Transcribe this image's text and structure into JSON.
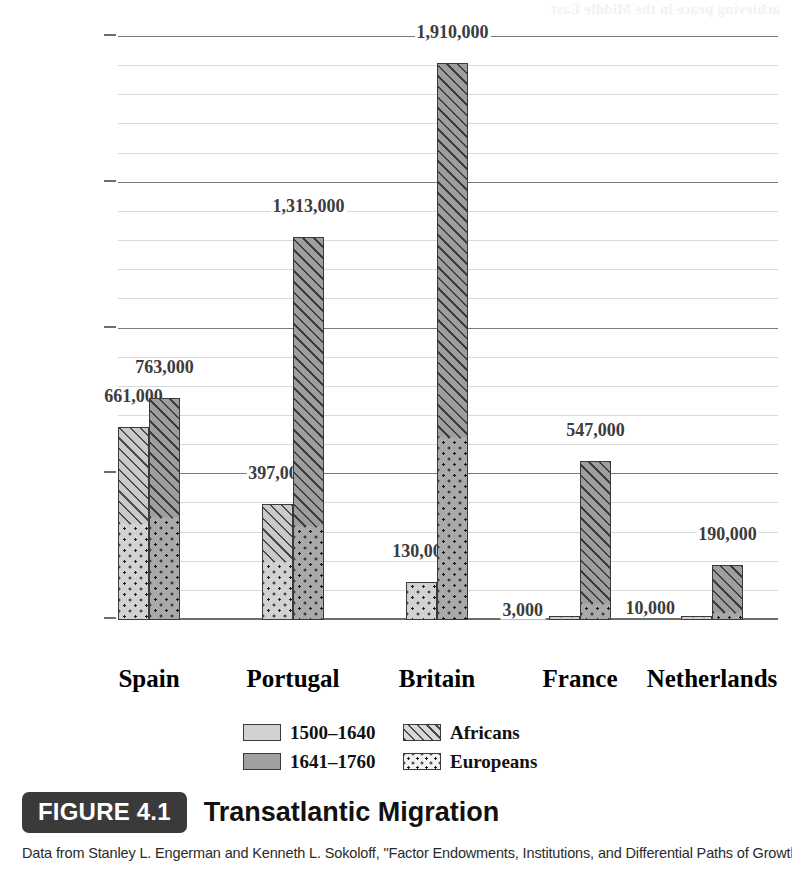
{
  "figure": {
    "badge": "FIGURE 4.1",
    "title": "Transatlantic Migration",
    "source": "Data from Stanley L. Engerman and Kenneth L. Sokoloff, \"Factor Endowments, Institutions, and Differential Paths of Growth",
    "ghost": "achieving peace in the Middle East"
  },
  "legend": {
    "period1": "1500–1640",
    "period2": "1641–1760",
    "africans": "Africans",
    "europeans": "Europeans"
  },
  "axis": {
    "yticks": [
      "0",
      "500,000",
      "1,000,000",
      "1,500,000",
      "2,000,000"
    ]
  },
  "labels": {
    "spain_p1": "661,000",
    "spain_p2": "763,000",
    "portugal_p1": "397,000",
    "portugal_p2": "1,313,000",
    "britain_p1": "130,000",
    "britain_p2": "1,910,000",
    "france_p1": "3,000",
    "france_p2": "547,000",
    "netherlands_p1": "10,000",
    "netherlands_p2": "190,000"
  },
  "chart_data": {
    "type": "bar",
    "title": "Transatlantic Migration",
    "xlabel": "",
    "ylabel": "",
    "ylim": [
      0,
      2000000
    ],
    "ytick_values": [
      0,
      500000,
      1000000,
      1500000,
      2000000
    ],
    "minor_tick_step": 100000,
    "grid": true,
    "legend_position": "bottom-center",
    "stacked": true,
    "categories": [
      "Spain",
      "Portugal",
      "Britain",
      "France",
      "Netherlands"
    ],
    "periods": [
      "1500–1640",
      "1641–1760"
    ],
    "components": [
      "Europeans",
      "Africans"
    ],
    "series": [
      {
        "name": "1500–1640",
        "total_label_values": [
          661000,
          397000,
          130000,
          3000,
          10000
        ],
        "components": [
          {
            "name": "Europeans",
            "values": [
              330000,
              200000,
              130000,
              3000,
              10000
            ]
          },
          {
            "name": "Africans",
            "values": [
              331000,
              197000,
              0,
              0,
              0
            ]
          }
        ]
      },
      {
        "name": "1641–1760",
        "total_label_values": [
          763000,
          1313000,
          1910000,
          547000,
          190000
        ],
        "components": [
          {
            "name": "Europeans",
            "values": [
              350000,
              320000,
              625000,
              55000,
              25000
            ]
          },
          {
            "name": "Africans",
            "values": [
              413000,
              993000,
              1285000,
              492000,
              165000
            ]
          }
        ]
      }
    ],
    "annotations": [
      "661,000",
      "763,000",
      "397,000",
      "1,313,000",
      "130,000",
      "1,910,000",
      "3,000",
      "547,000",
      "10,000",
      "190,000"
    ]
  }
}
